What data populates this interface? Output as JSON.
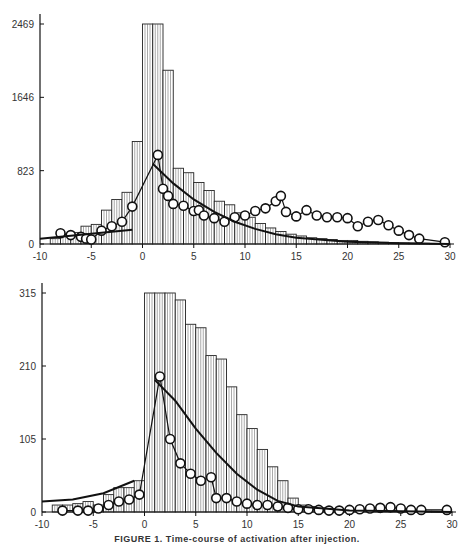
{
  "caption": "FIGURE 1. Time-course of activation after injection.",
  "chart_data": [
    {
      "type": "bar",
      "title": "",
      "xlabel": "",
      "ylabel": "",
      "xlim": [
        -10,
        30
      ],
      "ylim": [
        0,
        2469
      ],
      "yticks": [
        0,
        823,
        1646,
        2469
      ],
      "xticks": [
        -10,
        -5,
        0,
        5,
        10,
        15,
        20,
        25,
        30
      ],
      "grid": false,
      "histogram": {
        "bin_width": 1,
        "bin_starts": [
          -9,
          -8,
          -7,
          -6,
          -5,
          -4,
          -3,
          -2,
          -1,
          0,
          1,
          2,
          3,
          4,
          5,
          6,
          7,
          8,
          9,
          10,
          11,
          12,
          13,
          14,
          15,
          16,
          17,
          18,
          19,
          20,
          21,
          22,
          23,
          24,
          25,
          26,
          27,
          28,
          29
        ],
        "values": [
          60,
          110,
          130,
          200,
          220,
          380,
          500,
          580,
          1150,
          2469,
          2469,
          1950,
          850,
          800,
          690,
          600,
          480,
          440,
          350,
          300,
          230,
          180,
          140,
          110,
          90,
          70,
          60,
          50,
          40,
          40,
          30,
          25,
          20,
          15,
          12,
          10,
          8,
          6,
          5
        ]
      },
      "series": [
        {
          "name": "circles",
          "marker": "open-circle",
          "x": [
            -8,
            -7,
            -6,
            -5.5,
            -5,
            -4,
            -3,
            -2,
            -1,
            1.5,
            2,
            2.5,
            3,
            4,
            5,
            5.5,
            6,
            7,
            8,
            9,
            10,
            11,
            12,
            13,
            13.5,
            14,
            15,
            16,
            17,
            18,
            19,
            20,
            21,
            22,
            23,
            24,
            25,
            26,
            27,
            29.5
          ],
          "y": [
            120,
            100,
            80,
            60,
            50,
            150,
            200,
            250,
            420,
            1000,
            620,
            540,
            450,
            430,
            370,
            380,
            320,
            290,
            250,
            300,
            320,
            370,
            400,
            480,
            540,
            360,
            310,
            380,
            320,
            300,
            300,
            290,
            200,
            250,
            270,
            210,
            150,
            100,
            60,
            20
          ]
        },
        {
          "name": "fit-negative",
          "type": "line",
          "x": [
            -10,
            -1
          ],
          "y": [
            60,
            160
          ]
        },
        {
          "name": "fit-positive",
          "type": "line",
          "x": [
            1,
            3,
            5,
            7,
            9,
            11,
            13,
            15,
            20,
            25,
            30
          ],
          "y": [
            900,
            680,
            500,
            360,
            250,
            170,
            110,
            70,
            25,
            8,
            0
          ]
        }
      ]
    },
    {
      "type": "bar",
      "title": "",
      "xlabel": "",
      "ylabel": "",
      "xlim": [
        -10,
        30
      ],
      "ylim": [
        0,
        315
      ],
      "yticks": [
        0,
        105,
        210,
        315
      ],
      "xticks": [
        -10,
        -5,
        0,
        5,
        10,
        15,
        20,
        25,
        30
      ],
      "grid": false,
      "histogram": {
        "bin_width": 1,
        "bin_starts": [
          -9,
          -8,
          -7,
          -6,
          -5,
          -4,
          -3,
          -2,
          -1,
          0,
          1,
          2,
          3,
          4,
          5,
          6,
          7,
          8,
          9,
          10,
          11,
          12,
          13,
          14,
          15,
          16,
          17,
          18,
          19,
          20,
          21,
          22,
          23,
          24,
          25,
          26,
          27,
          28,
          29
        ],
        "values": [
          10,
          10,
          12,
          15,
          10,
          25,
          35,
          35,
          45,
          315,
          315,
          315,
          305,
          270,
          265,
          225,
          220,
          180,
          140,
          120,
          90,
          65,
          45,
          20,
          10,
          8,
          6,
          5,
          4,
          3,
          3,
          2,
          2,
          2,
          2,
          2,
          1,
          1,
          1
        ]
      },
      "series": [
        {
          "name": "circles",
          "marker": "open-circle",
          "x": [
            -8,
            -6.5,
            -5.5,
            -4.5,
            -3.5,
            -2.5,
            -1.5,
            -0.5,
            1.5,
            2.5,
            3.5,
            4.5,
            5.5,
            6.5,
            7,
            8,
            9,
            10,
            11,
            12,
            13,
            14,
            15,
            16,
            17,
            18,
            19,
            20,
            21,
            22,
            23,
            24,
            25,
            26,
            27,
            29.5
          ],
          "y": [
            2,
            2,
            2,
            5,
            10,
            15,
            18,
            25,
            195,
            105,
            70,
            55,
            45,
            50,
            20,
            20,
            15,
            12,
            10,
            10,
            8,
            6,
            4,
            4,
            3,
            2,
            2,
            3,
            4,
            5,
            6,
            7,
            5,
            3,
            3,
            3
          ]
        },
        {
          "name": "fit-negative",
          "type": "line",
          "x": [
            -10,
            -7,
            -4,
            -1
          ],
          "y": [
            15,
            18,
            27,
            45
          ]
        },
        {
          "name": "fit-positive",
          "type": "line",
          "x": [
            1,
            3,
            5,
            7,
            9,
            11,
            13,
            15,
            20,
            25,
            30
          ],
          "y": [
            190,
            160,
            120,
            85,
            55,
            32,
            16,
            8,
            2,
            1,
            0
          ]
        }
      ]
    }
  ]
}
